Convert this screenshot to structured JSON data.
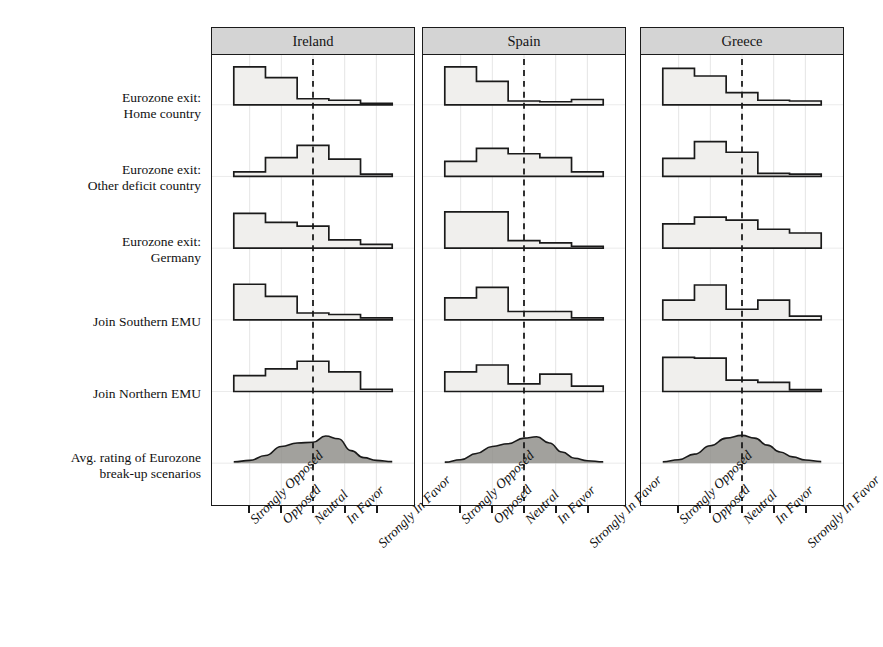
{
  "figure": {
    "type": "small-multiples-histogram-trellis",
    "background": "#ffffff",
    "ink_color": "#1a1a1a",
    "header_fill": "#d4d4d4",
    "bar_fill": "#f0efed",
    "density_fill": "#8e8c88"
  },
  "panels": [
    {
      "id": "ireland",
      "title": "Ireland"
    },
    {
      "id": "spain",
      "title": "Spain"
    },
    {
      "id": "greece",
      "title": "Greece"
    }
  ],
  "rows": [
    {
      "id": "exit-home",
      "label": "Eurozone exit:\nHome country"
    },
    {
      "id": "exit-other",
      "label": "Eurozone exit:\nOther deficit country"
    },
    {
      "id": "exit-germany",
      "label": "Eurozone exit:\nGermany"
    },
    {
      "id": "join-south",
      "label": "Join Southern EMU"
    },
    {
      "id": "join-north",
      "label": "Join Northern EMU"
    },
    {
      "id": "avg-rating",
      "label": "Avg. rating of Eurozone\nbreak-up scenarios"
    }
  ],
  "xaxis": {
    "categories": [
      "Strongly Opposed",
      "Opposed",
      "Neutral",
      "In Favor",
      "Strongly In Favor"
    ],
    "reference_line_at": "Neutral",
    "reference_line_style": "dashed"
  },
  "chart_data": {
    "type": "bar",
    "title": "",
    "subtitle": "",
    "xlabel": "",
    "ylabel": "",
    "grid": true,
    "legend": "none",
    "categories": [
      "Strongly Opposed",
      "Opposed",
      "Neutral",
      "In Favor",
      "Strongly In Favor"
    ],
    "ylim": [
      0,
      1
    ],
    "note": "Each cell is a normalized histogram of survey responses (proportion of respondents). Last row is a smoothed density curve of the average rating.",
    "panels": [
      {
        "panel": "Ireland",
        "series": [
          {
            "name": "Eurozone exit: Home country",
            "type": "bar",
            "values": [
              1.0,
              0.72,
              0.16,
              0.12,
              0.04
            ]
          },
          {
            "name": "Eurozone exit: Other deficit country",
            "type": "bar",
            "values": [
              0.12,
              0.5,
              0.82,
              0.46,
              0.06
            ]
          },
          {
            "name": "Eurozone exit: Germany",
            "type": "bar",
            "values": [
              0.92,
              0.68,
              0.58,
              0.22,
              0.1
            ]
          },
          {
            "name": "Join Southern EMU",
            "type": "bar",
            "values": [
              0.94,
              0.62,
              0.18,
              0.14,
              0.05
            ]
          },
          {
            "name": "Join Northern EMU",
            "type": "bar",
            "values": [
              0.42,
              0.6,
              0.8,
              0.52,
              0.06
            ]
          },
          {
            "name": "Avg. rating of Eurozone break-up scenarios",
            "type": "density",
            "x": [
              0.0,
              0.1,
              0.2,
              0.3,
              0.4,
              0.5,
              0.58,
              0.66,
              0.74,
              0.82,
              0.9,
              1.0
            ],
            "values": [
              0.04,
              0.08,
              0.22,
              0.48,
              0.58,
              0.6,
              0.78,
              0.7,
              0.36,
              0.16,
              0.08,
              0.05
            ]
          }
        ]
      },
      {
        "panel": "Spain",
        "series": [
          {
            "name": "Eurozone exit: Home country",
            "type": "bar",
            "values": [
              1.0,
              0.62,
              0.1,
              0.08,
              0.14
            ]
          },
          {
            "name": "Eurozone exit: Other deficit country",
            "type": "bar",
            "values": [
              0.4,
              0.74,
              0.6,
              0.5,
              0.12
            ]
          },
          {
            "name": "Eurozone exit: Germany",
            "type": "bar",
            "values": [
              0.96,
              0.96,
              0.2,
              0.14,
              0.05
            ]
          },
          {
            "name": "Join Southern EMU",
            "type": "bar",
            "values": [
              0.58,
              0.86,
              0.22,
              0.22,
              0.05
            ]
          },
          {
            "name": "Join Northern EMU",
            "type": "bar",
            "values": [
              0.52,
              0.7,
              0.2,
              0.46,
              0.14
            ]
          },
          {
            "name": "Avg. rating of Eurozone break-up scenarios",
            "type": "density",
            "x": [
              0.0,
              0.1,
              0.2,
              0.3,
              0.4,
              0.5,
              0.58,
              0.66,
              0.74,
              0.82,
              0.9,
              1.0
            ],
            "values": [
              0.03,
              0.1,
              0.28,
              0.48,
              0.56,
              0.72,
              0.76,
              0.58,
              0.32,
              0.14,
              0.07,
              0.04
            ]
          }
        ]
      },
      {
        "panel": "Greece",
        "series": [
          {
            "name": "Eurozone exit: Home country",
            "type": "bar",
            "values": [
              0.96,
              0.76,
              0.32,
              0.12,
              0.1
            ]
          },
          {
            "name": "Eurozone exit: Other deficit country",
            "type": "bar",
            "values": [
              0.48,
              0.92,
              0.64,
              0.08,
              0.06
            ]
          },
          {
            "name": "Eurozone exit: Germany",
            "type": "bar",
            "values": [
              0.64,
              0.82,
              0.74,
              0.5,
              0.4
            ]
          },
          {
            "name": "Join Southern EMU",
            "type": "bar",
            "values": [
              0.52,
              0.92,
              0.28,
              0.52,
              0.1
            ]
          },
          {
            "name": "Join Northern EMU",
            "type": "bar",
            "values": [
              0.9,
              0.88,
              0.3,
              0.24,
              0.05
            ]
          },
          {
            "name": "Avg. rating of Eurozone break-up scenarios",
            "type": "density",
            "x": [
              0.0,
              0.1,
              0.2,
              0.3,
              0.4,
              0.5,
              0.58,
              0.66,
              0.74,
              0.82,
              0.9,
              1.0
            ],
            "values": [
              0.04,
              0.1,
              0.26,
              0.5,
              0.72,
              0.8,
              0.72,
              0.52,
              0.32,
              0.18,
              0.09,
              0.05
            ]
          }
        ]
      }
    ]
  },
  "layout": {
    "panel_left": [
      211,
      422,
      640
    ],
    "panel_width": 204,
    "plot_inset_left": 22,
    "plot_inset_right": 22,
    "row_baselines": [
      77,
      149,
      221,
      293,
      365,
      437
    ],
    "row_height": 72
  }
}
